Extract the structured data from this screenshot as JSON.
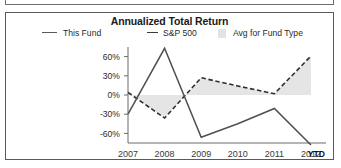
{
  "card": {
    "title": "Annualized Total Return"
  },
  "legend": [
    {
      "label": "This Fund",
      "marker": "solid-line-swatch",
      "color": "#555a5e"
    },
    {
      "label": "S&P 500",
      "marker": "dashed-line-swatch",
      "color": "#3a3a3a"
    },
    {
      "label": "Avg for Fund Type",
      "marker": "filled-box-swatch",
      "color": "#e3e3e3"
    }
  ],
  "axis": {
    "y_ticks": [
      "60%",
      "30%",
      "0%",
      "-30%",
      "-60%"
    ],
    "x_ticks": [
      "2007",
      "2008",
      "2009",
      "2010",
      "2011",
      "2012"
    ],
    "x_suffix": "YTD"
  },
  "chart_data": {
    "type": "line",
    "title": "Annualized Total Return",
    "xlabel": "",
    "ylabel": "",
    "x": [
      "2007",
      "2008",
      "2009",
      "2010",
      "2011",
      "2012"
    ],
    "x_note": "2012 value is YTD",
    "ylim": [
      -75,
      75
    ],
    "yticks": [
      -60,
      -30,
      0,
      30,
      60
    ],
    "ytick_labels": [
      "-60%",
      "-30%",
      "0%",
      "30%",
      "60%"
    ],
    "grid": false,
    "legend_position": "top",
    "series": [
      {
        "name": "This Fund",
        "style": "solid",
        "color": "#4c5155",
        "values": [
          -30,
          73,
          -66,
          -45,
          -21,
          -78
        ]
      },
      {
        "name": "S&P 500",
        "style": "dashed",
        "color": "#2f2f2f",
        "values": [
          4,
          -36,
          27,
          14,
          2,
          61
        ]
      },
      {
        "name": "Avg for Fund Type",
        "style": "area-band",
        "color": "#e3e3e3",
        "values": [
          0,
          0,
          0,
          0,
          0,
          0
        ]
      }
    ],
    "annotations": []
  }
}
